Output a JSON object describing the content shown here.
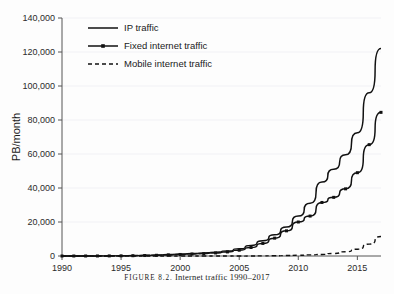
{
  "caption": {
    "figure_label": "FIGURE 8.2.",
    "text": "Internet traffic 1990–2017"
  },
  "colors": {
    "line": "#111111",
    "axis": "#555555",
    "grid": "#eeeef2",
    "background": "#fdfdfd",
    "text": "#1a1a1a"
  },
  "chart_data": {
    "type": "line",
    "title": "",
    "subtitle": "",
    "xlabel": "",
    "ylabel": "PB/month",
    "xlim": [
      1990,
      2017
    ],
    "ylim": [
      0,
      140000
    ],
    "xticks": [
      1990,
      1995,
      2000,
      2005,
      2010,
      2015
    ],
    "xtick_labels": [
      "1990",
      "1995",
      "2000",
      "2005",
      "2010",
      "2015"
    ],
    "yticks": [
      0,
      20000,
      40000,
      60000,
      80000,
      100000,
      120000,
      140000
    ],
    "ytick_labels": [
      "0",
      "20,000",
      "40,000",
      "60,000",
      "80,000",
      "100,000",
      "120,000",
      "140,000"
    ],
    "grid": true,
    "legend_position": "top-left",
    "x": [
      1990,
      1991,
      1992,
      1993,
      1994,
      1995,
      1996,
      1997,
      1998,
      1999,
      2000,
      2001,
      2002,
      2003,
      2004,
      2005,
      2006,
      2007,
      2008,
      2009,
      2010,
      2011,
      2012,
      2013,
      2014,
      2015,
      2016,
      2017
    ],
    "series": [
      {
        "name": "IP traffic",
        "style": "solid",
        "markers": false,
        "values": [
          5,
          10,
          20,
          40,
          80,
          150,
          250,
          400,
          600,
          900,
          1200,
          1500,
          1800,
          2200,
          3000,
          4200,
          6200,
          9000,
          12500,
          17000,
          23500,
          31000,
          43500,
          51000,
          59500,
          72500,
          96000,
          122000
        ]
      },
      {
        "name": "Fixed internet traffic",
        "style": "solid",
        "markers": true,
        "values": [
          3,
          6,
          12,
          25,
          50,
          100,
          170,
          280,
          420,
          650,
          900,
          1150,
          1400,
          1800,
          2400,
          3400,
          5000,
          7400,
          10500,
          14800,
          20000,
          23500,
          31500,
          34500,
          39500,
          49000,
          65500,
          84500
        ]
      },
      {
        "name": "Mobile internet traffic",
        "style": "dashed",
        "markers": false,
        "values": [
          0,
          0,
          0,
          0,
          0,
          0,
          0,
          0,
          0,
          0,
          0,
          0,
          0,
          0,
          0,
          10,
          25,
          60,
          130,
          250,
          420,
          650,
          900,
          1500,
          2500,
          4000,
          7000,
          11500
        ]
      }
    ]
  },
  "legend": {
    "items": [
      {
        "label": "IP traffic",
        "style": "solid",
        "marker": false
      },
      {
        "label": "Fixed internet traffic",
        "style": "solid",
        "marker": true
      },
      {
        "label": "Mobile internet traffic",
        "style": "dashed",
        "marker": false
      }
    ]
  }
}
